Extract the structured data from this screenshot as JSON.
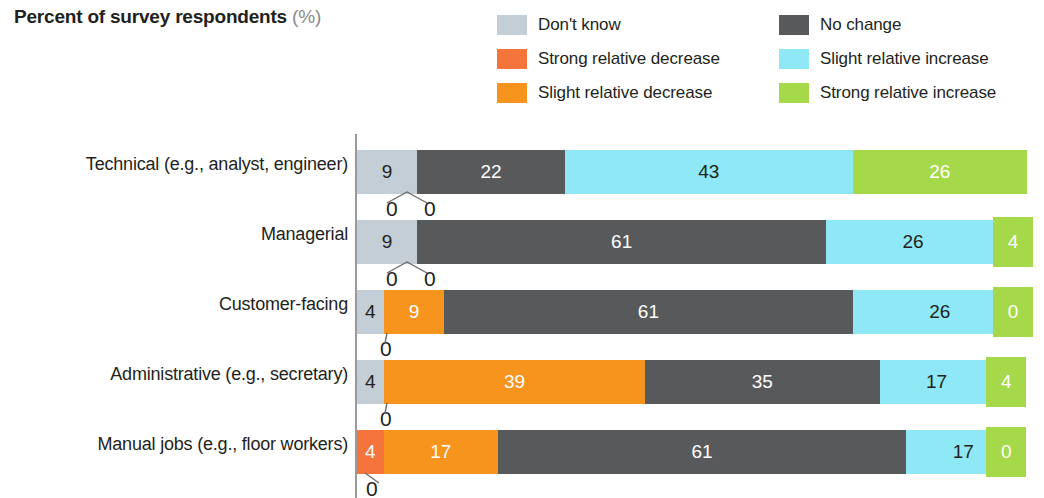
{
  "title": {
    "main": "Percent of survey respondents",
    "unit": "(%)"
  },
  "legend": {
    "items": [
      {
        "label": "Don't know",
        "color": "#c3ced6",
        "key": "dont_know"
      },
      {
        "label": "No change",
        "color": "#58595b",
        "key": "no_change"
      },
      {
        "label": "Strong relative decrease",
        "color": "#f4743b",
        "key": "strong_decrease"
      },
      {
        "label": "Slight relative increase",
        "color": "#8fe8f5",
        "key": "slight_increase"
      },
      {
        "label": "Slight relative decrease",
        "color": "#f7941e",
        "key": "slight_decrease"
      },
      {
        "label": "Strong relative increase",
        "color": "#a6d94a",
        "key": "strong_increase"
      }
    ]
  },
  "chart_data": {
    "type": "bar",
    "orientation": "horizontal",
    "stacked": true,
    "title": "Percent of survey respondents (%)",
    "xlabel": "",
    "ylabel": "",
    "xlim": [
      0,
      100
    ],
    "grid": false,
    "legend_position": "top-right",
    "categories": [
      "Technical (e.g., analyst, engineer)",
      "Managerial",
      "Customer-facing",
      "Administrative (e.g., secretary)",
      "Manual jobs (e.g., floor workers)"
    ],
    "series": [
      {
        "name": "Don't know",
        "color": "#c3ced6",
        "values": [
          9,
          9,
          4,
          4,
          4
        ]
      },
      {
        "name": "Strong relative decrease",
        "color": "#f4743b",
        "values": [
          0,
          0,
          0,
          0,
          0
        ]
      },
      {
        "name": "Slight relative decrease",
        "color": "#f7941e",
        "values": [
          0,
          0,
          9,
          39,
          17
        ]
      },
      {
        "name": "No change",
        "color": "#58595b",
        "values": [
          22,
          61,
          61,
          35,
          61
        ]
      },
      {
        "name": "Slight relative increase",
        "color": "#8fe8f5",
        "values": [
          43,
          26,
          26,
          17,
          17
        ]
      },
      {
        "name": "Strong relative increase",
        "color": "#a6d94a",
        "values": [
          26,
          4,
          0,
          4,
          0
        ]
      }
    ]
  },
  "rows": [
    {
      "label": "Technical (e.g., analyst, engineer)",
      "segments": [
        {
          "value": "9",
          "pct": 9,
          "color": "#c3ced6",
          "text": "dark",
          "show": true
        },
        {
          "value": "0",
          "pct": 0,
          "color": "#f4743b",
          "text": "dark",
          "show": false
        },
        {
          "value": "0",
          "pct": 0,
          "color": "#f7941e",
          "text": "dark",
          "show": false
        },
        {
          "value": "22",
          "pct": 22,
          "color": "#58595b",
          "text": "light",
          "show": true
        },
        {
          "value": "43",
          "pct": 43,
          "color": "#8fe8f5",
          "text": "dark",
          "show": true
        },
        {
          "value": "26",
          "pct": 26,
          "color": "#a6d94a",
          "text": "light",
          "show": true
        }
      ],
      "zeros": [
        {
          "value": "0",
          "x": 386,
          "leader": "double-left"
        },
        {
          "value": "0",
          "x": 424,
          "leader": "double-right"
        }
      ],
      "endbox": null
    },
    {
      "label": "Managerial",
      "segments": [
        {
          "value": "9",
          "pct": 9,
          "color": "#c3ced6",
          "text": "dark",
          "show": true
        },
        {
          "value": "0",
          "pct": 0,
          "color": "#f4743b",
          "text": "dark",
          "show": false
        },
        {
          "value": "0",
          "pct": 0,
          "color": "#f7941e",
          "text": "dark",
          "show": false
        },
        {
          "value": "61",
          "pct": 61,
          "color": "#58595b",
          "text": "light",
          "show": true
        },
        {
          "value": "26",
          "pct": 26,
          "color": "#8fe8f5",
          "text": "dark",
          "show": true
        },
        {
          "value": "4",
          "pct": 4,
          "color": "#a6d94a",
          "text": "light",
          "show": false
        }
      ],
      "zeros": [
        {
          "value": "0",
          "x": 386,
          "leader": "double-left"
        },
        {
          "value": "0",
          "x": 424,
          "leader": "double-right"
        }
      ],
      "endbox": {
        "value": "4",
        "color": "#a6d94a"
      }
    },
    {
      "label": "Customer-facing",
      "segments": [
        {
          "value": "4",
          "pct": 4,
          "color": "#c3ced6",
          "text": "dark",
          "show": true
        },
        {
          "value": "0",
          "pct": 0,
          "color": "#f4743b",
          "text": "dark",
          "show": false
        },
        {
          "value": "9",
          "pct": 9,
          "color": "#f7941e",
          "text": "light",
          "show": true
        },
        {
          "value": "61",
          "pct": 61,
          "color": "#58595b",
          "text": "light",
          "show": true
        },
        {
          "value": "26",
          "pct": 26,
          "color": "#8fe8f5",
          "text": "dark",
          "show": true
        },
        {
          "value": "0",
          "pct": 0,
          "color": "#a6d94a",
          "text": "light",
          "show": false
        }
      ],
      "zeros": [
        {
          "value": "0",
          "x": 380,
          "leader": "single"
        }
      ],
      "endbox": {
        "value": "0",
        "color": "#a6d94a"
      }
    },
    {
      "label": "Administrative (e.g., secretary)",
      "segments": [
        {
          "value": "4",
          "pct": 4,
          "color": "#c3ced6",
          "text": "dark",
          "show": true
        },
        {
          "value": "0",
          "pct": 0,
          "color": "#f4743b",
          "text": "dark",
          "show": false
        },
        {
          "value": "39",
          "pct": 39,
          "color": "#f7941e",
          "text": "light",
          "show": true
        },
        {
          "value": "35",
          "pct": 35,
          "color": "#58595b",
          "text": "light",
          "show": true
        },
        {
          "value": "17",
          "pct": 17,
          "color": "#8fe8f5",
          "text": "dark",
          "show": true
        },
        {
          "value": "4",
          "pct": 4,
          "color": "#a6d94a",
          "text": "light",
          "show": false
        }
      ],
      "zeros": [
        {
          "value": "0",
          "x": 380,
          "leader": "single"
        }
      ],
      "endbox": {
        "value": "4",
        "color": "#a6d94a"
      }
    },
    {
      "label": "Manual jobs (e.g., floor workers)",
      "segments": [
        {
          "value": "4",
          "pct": 4,
          "color": "#f4743b",
          "text": "light",
          "show": true
        },
        {
          "value": "0",
          "pct": 0,
          "color": "#f4743b",
          "text": "dark",
          "show": false
        },
        {
          "value": "17",
          "pct": 17,
          "color": "#f7941e",
          "text": "light",
          "show": true
        },
        {
          "value": "61",
          "pct": 61,
          "color": "#58595b",
          "text": "light",
          "show": true
        },
        {
          "value": "17",
          "pct": 17,
          "color": "#8fe8f5",
          "text": "dark",
          "show": true
        },
        {
          "value": "0",
          "pct": 0,
          "color": "#a6d94a",
          "text": "light",
          "show": false
        }
      ],
      "zeros": [
        {
          "value": "0",
          "x": 366,
          "leader": "single-left"
        }
      ],
      "endbox": {
        "value": "0",
        "color": "#a6d94a"
      }
    }
  ]
}
